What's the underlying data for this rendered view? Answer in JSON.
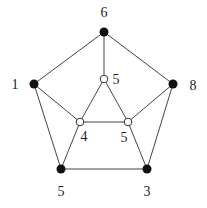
{
  "diagram": {
    "type": "graph",
    "colors": {
      "edge": "#444444",
      "filled_node": "#111111",
      "open_node_fill": "#ffffff",
      "open_node_stroke": "#333333",
      "label": "#222222"
    },
    "nodes": [
      {
        "id": "top",
        "x": 104,
        "y": 32,
        "style": "filled",
        "label": "6",
        "lx": 104,
        "ly": 17
      },
      {
        "id": "left",
        "x": 34,
        "y": 84,
        "style": "filled",
        "label": "1",
        "lx": 15,
        "ly": 89
      },
      {
        "id": "right",
        "x": 173,
        "y": 84,
        "style": "filled",
        "label": "8",
        "lx": 193,
        "ly": 90
      },
      {
        "id": "botleft",
        "x": 61,
        "y": 169,
        "style": "filled",
        "label": "5",
        "lx": 61,
        "ly": 196
      },
      {
        "id": "botright",
        "x": 147,
        "y": 169,
        "style": "filled",
        "label": "3",
        "lx": 147,
        "ly": 196
      },
      {
        "id": "in_top",
        "x": 104,
        "y": 79,
        "style": "open",
        "label": "5",
        "lx": 116,
        "ly": 84
      },
      {
        "id": "in_left",
        "x": 80,
        "y": 122,
        "style": "open",
        "label": "4",
        "lx": 84,
        "ly": 141
      },
      {
        "id": "in_right",
        "x": 128,
        "y": 122,
        "style": "open",
        "label": "5",
        "lx": 124,
        "ly": 142
      }
    ],
    "edges": [
      [
        "top",
        "left"
      ],
      [
        "top",
        "right"
      ],
      [
        "left",
        "botleft"
      ],
      [
        "right",
        "botright"
      ],
      [
        "botleft",
        "botright"
      ],
      [
        "top",
        "in_top"
      ],
      [
        "left",
        "in_left"
      ],
      [
        "right",
        "in_right"
      ],
      [
        "botleft",
        "in_left"
      ],
      [
        "botright",
        "in_right"
      ],
      [
        "in_top",
        "in_left"
      ],
      [
        "in_top",
        "in_right"
      ],
      [
        "in_left",
        "in_right"
      ]
    ]
  }
}
